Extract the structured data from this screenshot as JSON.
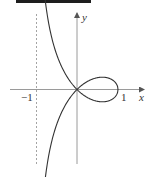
{
  "diagram": {
    "axes": {
      "x_label": "x",
      "y_label": "y",
      "tick_labels": {
        "neg_one": "−1",
        "one": "1"
      }
    },
    "asymptote": {
      "x": -1,
      "style": "dashed"
    },
    "curve": {
      "equation": "y^2 = x^2(1-x)/(1+x)",
      "x_range": [
        -0.92,
        1
      ]
    },
    "colors": {
      "curve": "#333333",
      "axes": "#9a9a9a",
      "asymptote": "#9a9a9a",
      "top_bar": "#1e1e1e"
    }
  }
}
